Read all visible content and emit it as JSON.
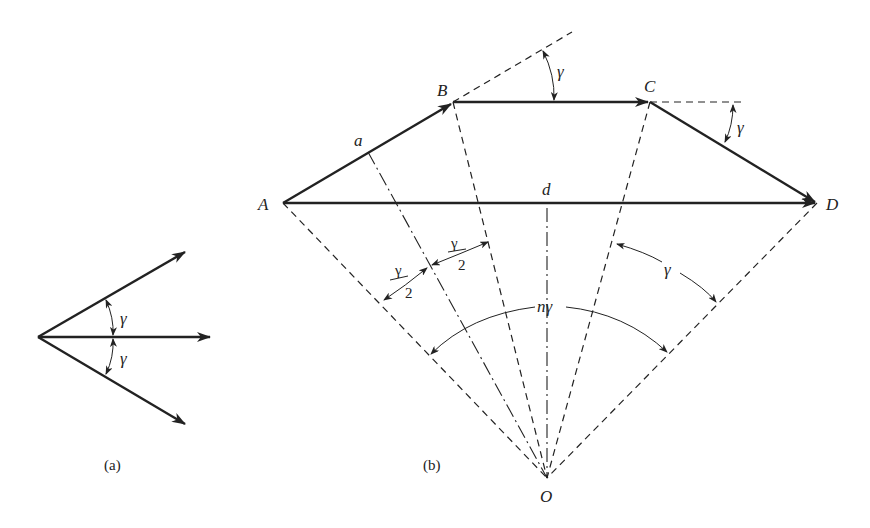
{
  "figure_a": {
    "caption": "(a)",
    "angle_labels": [
      "γ",
      "γ"
    ]
  },
  "figure_b": {
    "caption": "(b)",
    "points": {
      "A": "A",
      "B": "B",
      "C": "C",
      "D": "D",
      "O": "O"
    },
    "segment_labels": {
      "a": "a",
      "d": "d"
    },
    "angle_labels": {
      "gamma_at_B": "γ",
      "gamma_at_C": "γ",
      "half_gamma_left_num": "γ",
      "half_gamma_left_den": "2",
      "half_gamma_right_num": "γ",
      "half_gamma_right_den": "2",
      "gamma_right_sector": "γ",
      "n_gamma": "nγ"
    }
  },
  "colors": {
    "line": "#222222",
    "background": "#ffffff"
  }
}
